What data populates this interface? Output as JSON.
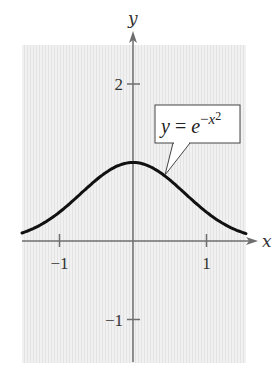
{
  "chart_data": {
    "type": "line",
    "title": "",
    "xlabel": "x",
    "ylabel": "y",
    "function": "y = e^(-x^2)",
    "annotation": {
      "text_base": "y = e",
      "exponent": "−x",
      "exponent_power": "2"
    },
    "xlim": [
      -1.52,
      1.54
    ],
    "ylim": [
      -1.55,
      2.5
    ],
    "x_ticks": [
      {
        "value": -1,
        "label": "−1"
      },
      {
        "value": 1,
        "label": "1"
      }
    ],
    "y_ticks": [
      {
        "value": 2,
        "label": "2"
      },
      {
        "value": -1,
        "label": "−1"
      }
    ],
    "x": [
      -1.5,
      -1.25,
      -1.0,
      -0.75,
      -0.5,
      -0.25,
      0,
      0.25,
      0.5,
      0.75,
      1.0,
      1.25,
      1.5
    ],
    "values": [
      0.105,
      0.21,
      0.368,
      0.57,
      0.779,
      0.939,
      1.0,
      0.939,
      0.779,
      0.57,
      0.368,
      0.21,
      0.105
    ],
    "grid": true,
    "legend": null
  },
  "colors": {
    "background": "#ffffff",
    "plot_area": "#efefef",
    "grid_line": "#e2e2e2",
    "axis": "#6e6e6e",
    "curve": "#111111"
  },
  "layout": {
    "origin_px": [
      133,
      241
    ],
    "x_unit_px": 73.5,
    "y_unit_px": 78.5,
    "plot_box": [
      22,
      45,
      246,
      363
    ]
  }
}
